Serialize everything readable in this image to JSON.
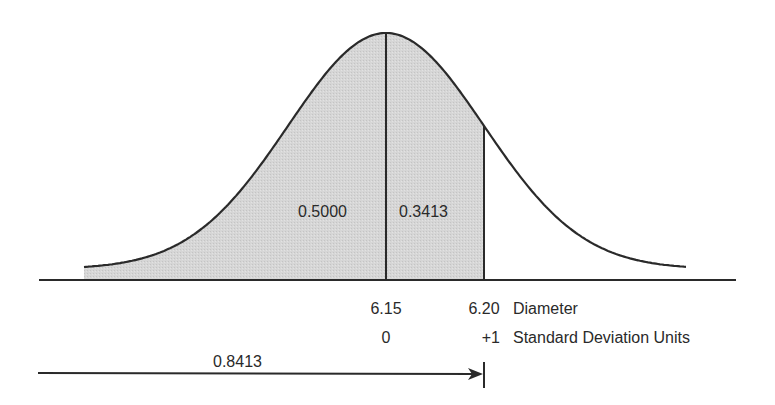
{
  "figure": {
    "type": "normal-distribution-diagram",
    "areas": {
      "left_of_mean": "0.5000",
      "mean_to_plus1": "0.3413",
      "cumulative": "0.8413"
    },
    "axis": {
      "diameter_ticks": [
        "6.15",
        "6.20"
      ],
      "diameter_label": "Diameter",
      "sd_ticks": [
        "0",
        "+1"
      ],
      "sd_label": "Standard Deviation Units"
    },
    "colors": {
      "line": "#2a2a2a",
      "shade": "#d4d4d4",
      "background": "#ffffff"
    }
  },
  "chart_data": {
    "type": "area",
    "title": "",
    "x_units": "Standard Deviation Units",
    "x_alt_units": "Diameter",
    "mean": 6.15,
    "sigma": 0.05,
    "ticks": [
      {
        "z": 0,
        "diameter": 6.15
      },
      {
        "z": 1,
        "diameter": 6.2
      }
    ],
    "regions": [
      {
        "from_z": "-inf",
        "to_z": 0,
        "area": 0.5,
        "shaded": true
      },
      {
        "from_z": 0,
        "to_z": 1,
        "area": 0.3413,
        "shaded": true
      },
      {
        "from_z": 1,
        "to_z": "inf",
        "area": 0.1587,
        "shaded": false
      }
    ],
    "cumulative_arrow": {
      "to_z": 1,
      "value": 0.8413
    },
    "grid": false,
    "legend": null
  }
}
